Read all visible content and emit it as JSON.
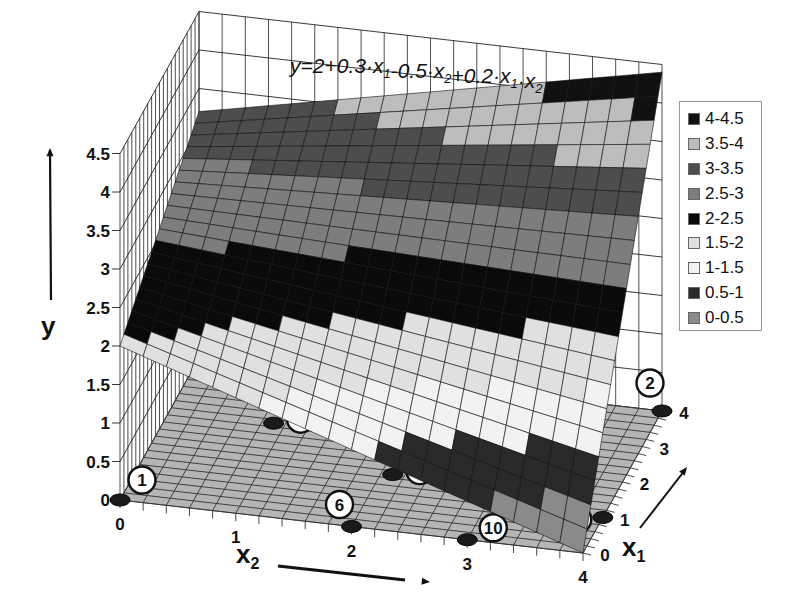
{
  "chart_data": {
    "type": "surface3d",
    "title": "y=2+0.3·x1-0.5·x2+0.2·x1·x2",
    "title_parts": [
      {
        "t": "y=2+0.3·x",
        "sub": false
      },
      {
        "t": "1",
        "sub": true
      },
      {
        "t": "-0.5·x",
        "sub": false
      },
      {
        "t": "2",
        "sub": true
      },
      {
        "t": "+0.2·x",
        "sub": false
      },
      {
        "t": "1",
        "sub": true
      },
      {
        "t": "·x",
        "sub": false
      },
      {
        "t": "2",
        "sub": true
      }
    ],
    "equation": {
      "b0": 2,
      "b1": 0.3,
      "b2": -0.5,
      "b12": 0.2
    },
    "x1": {
      "label": "x",
      "sub": "1",
      "ticks": [
        "0",
        "1",
        "2",
        "3",
        "4"
      ],
      "range": [
        0,
        4
      ]
    },
    "x2": {
      "label": "x",
      "sub": "2",
      "ticks": [
        "0",
        "1",
        "2",
        "3",
        "4"
      ],
      "range": [
        0,
        4
      ]
    },
    "y": {
      "label": "y",
      "ticks": [
        "0",
        "0.5",
        "1",
        "1.5",
        "2",
        "2.5",
        "3",
        "3.5",
        "4",
        "4.5"
      ],
      "range": [
        0,
        4.5
      ]
    },
    "legend": [
      {
        "label": "4-4.5",
        "color": "#111111"
      },
      {
        "label": "3.5-4",
        "color": "#bdbdbd"
      },
      {
        "label": "3-3.5",
        "color": "#4d4d4d"
      },
      {
        "label": "2.5-3",
        "color": "#7d7d7d"
      },
      {
        "label": "2-2.5",
        "color": "#0a0a0a"
      },
      {
        "label": "1.5-2",
        "color": "#e0e0e0"
      },
      {
        "label": "1-1.5",
        "color": "#f2f2f2"
      },
      {
        "label": "0.5-1",
        "color": "#2a2a2a"
      },
      {
        "label": "0-0.5",
        "color": "#8a8a8a"
      }
    ],
    "design_points": [
      {
        "id": "1",
        "x1": 0,
        "x2": 0
      },
      {
        "id": "2",
        "x1": 4,
        "x2": 4
      },
      {
        "id": "3",
        "x1": 2.5,
        "x2": 3.2
      },
      {
        "id": "4",
        "x1": 1,
        "x2": 4
      },
      {
        "id": "5",
        "x1": 3.2,
        "x2": 1.3
      },
      {
        "id": "6",
        "x1": 0,
        "x2": 2
      },
      {
        "id": "7",
        "x1": 1.5,
        "x2": 2.1
      },
      {
        "id": "8",
        "x1": 4,
        "x2": 1.5
      },
      {
        "id": "9",
        "x1": 2.5,
        "x2": 0.9
      },
      {
        "id": "10",
        "x1": 0,
        "x2": 3
      }
    ],
    "grid": true
  }
}
